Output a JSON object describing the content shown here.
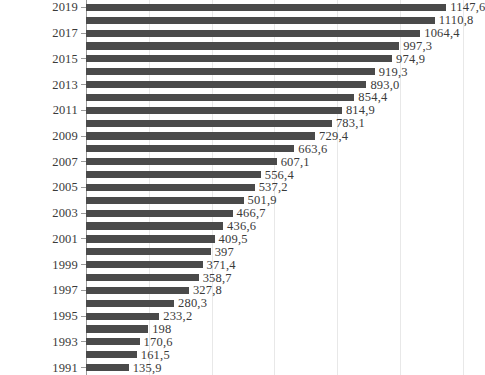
{
  "chart_data": {
    "type": "bar",
    "orientation": "horizontal",
    "title": "",
    "subtitle": "",
    "xlabel": "",
    "ylabel": "",
    "grid": true,
    "legend": null,
    "xlim": [
      0,
      1200
    ],
    "x_gridline_values": [
      200,
      400,
      600,
      800,
      1000,
      1200
    ],
    "y_tick_labels": [
      "2019",
      "2017",
      "2015",
      "2013",
      "2011",
      "2009",
      "2007",
      "2005",
      "2003",
      "2001",
      "1999",
      "1997",
      "1995",
      "1993",
      "1991"
    ],
    "bar_color": "#4a4a4a",
    "gridline_color": "#e8e8e8",
    "axis_color": "#9a9a9a",
    "categories": [
      "2019",
      "2018",
      "2017",
      "2016",
      "2015",
      "2014",
      "2013",
      "2012",
      "2011",
      "2010",
      "2009",
      "2008",
      "2007",
      "2006",
      "2005",
      "2004",
      "2003",
      "2002",
      "2001",
      "2000",
      "1999",
      "1998",
      "1997",
      "1996",
      "1995",
      "1994",
      "1993",
      "1992",
      "1991"
    ],
    "values": [
      1147.6,
      1110.8,
      1064.4,
      997.3,
      974.9,
      919.3,
      893.0,
      854.4,
      814.9,
      783.1,
      729.4,
      663.6,
      607.1,
      556.4,
      537.2,
      501.9,
      466.7,
      436.6,
      409.5,
      397,
      371.4,
      358.7,
      327.8,
      280.3,
      233.2,
      198,
      170.6,
      161.5,
      135.9
    ],
    "value_labels": [
      "1147,6",
      "1110,8",
      "1064,4",
      "997,3",
      "974,9",
      "919,3",
      "893,0",
      "854,4",
      "814,9",
      "783,1",
      "729,4",
      "663,6",
      "607,1",
      "556,4",
      "537,2",
      "501,9",
      "466,7",
      "436,6",
      "409,5",
      "397",
      "371,4",
      "358,7",
      "327,8",
      "280,3",
      "233,2",
      "198",
      "170,6",
      "161,5",
      "135,9"
    ],
    "labeled_categories": [
      "2019",
      "",
      "2017",
      "",
      "2015",
      "",
      "2013",
      "",
      "2011",
      "",
      "2009",
      "",
      "2007",
      "",
      "2005",
      "",
      "2003",
      "",
      "2001",
      "",
      "1999",
      "",
      "1997",
      "",
      "1995",
      "",
      "1993",
      "",
      "1991"
    ]
  }
}
